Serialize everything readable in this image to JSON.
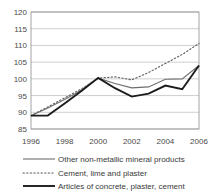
{
  "chart_data": {
    "type": "line",
    "title": "",
    "subtitle": "",
    "xlabel": "",
    "ylabel": "",
    "x": [
      1996,
      1997,
      1998,
      1999,
      2000,
      2001,
      2002,
      2003,
      2004,
      2005,
      2006
    ],
    "xlim": [
      1996,
      2006
    ],
    "ylim": [
      85,
      120
    ],
    "ytick_labels": [
      "120",
      "115",
      "110",
      "105",
      "100",
      "95",
      "90",
      "85"
    ],
    "ytick_values": [
      120,
      115,
      110,
      105,
      100,
      95,
      90,
      85
    ],
    "xtick_labels": [
      "1996",
      "1998",
      "2000",
      "2002",
      "2004",
      "2006"
    ],
    "xtick_values": [
      1996,
      1998,
      2000,
      2002,
      2004,
      2006
    ],
    "grid": true,
    "legend_position": "bottom",
    "series": [
      {
        "name": "Other non-metallic mineral products",
        "style": "solid-thin",
        "values": [
          89.0,
          91.3,
          93.8,
          96.6,
          100.2,
          98.6,
          97.3,
          97.6,
          99.9,
          100.0,
          104.0
        ]
      },
      {
        "name": "Cement, lime and plaster",
        "style": "dotted",
        "values": [
          89.0,
          91.6,
          94.3,
          97.0,
          100.2,
          100.6,
          99.7,
          101.9,
          104.6,
          107.3,
          110.6
        ]
      },
      {
        "name": "Articles of concrete, plaster, cement",
        "style": "solid-thick",
        "values": [
          89.0,
          89.0,
          92.6,
          96.4,
          100.3,
          97.2,
          94.7,
          95.6,
          98.0,
          96.9,
          104.0
        ]
      }
    ]
  },
  "legend": {
    "items": [
      {
        "label": "Other non-metallic mineral products",
        "style": "solid-thin"
      },
      {
        "label": "Cement, lime and plaster",
        "style": "dotted"
      },
      {
        "label": "Articles of concrete, plaster, cement",
        "style": "solid-thick"
      }
    ]
  }
}
